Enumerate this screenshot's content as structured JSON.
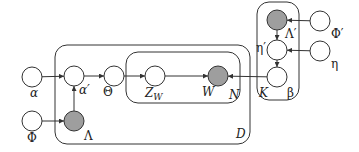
{
  "diagram": {
    "type": "plate-notation graphical model",
    "nodes": [
      {
        "id": "alpha",
        "label": "α",
        "observed": false,
        "cx": 32,
        "cy": 77,
        "lx": 30,
        "ly": 97,
        "italic": true
      },
      {
        "id": "phi",
        "label": "Φ",
        "observed": false,
        "cx": 32,
        "cy": 121,
        "lx": 27,
        "ly": 142,
        "italic": false
      },
      {
        "id": "alpha_prime",
        "label": "α′",
        "observed": false,
        "cx": 74,
        "cy": 76,
        "lx": 79,
        "ly": 94,
        "italic": true
      },
      {
        "id": "lambda",
        "label": "Λ",
        "observed": true,
        "cx": 74,
        "cy": 121,
        "lx": 84,
        "ly": 140,
        "italic": false
      },
      {
        "id": "theta",
        "label": "Θ",
        "observed": false,
        "cx": 114,
        "cy": 76,
        "lx": 103,
        "ly": 96,
        "italic": false
      },
      {
        "id": "z_w",
        "label": "Z",
        "sub": "W",
        "observed": false,
        "cx": 155,
        "cy": 76,
        "lx": 145,
        "ly": 97,
        "italic": true
      },
      {
        "id": "w",
        "label": "W",
        "observed": true,
        "cx": 218,
        "cy": 76,
        "lx": 202,
        "ly": 96,
        "italic": true
      },
      {
        "id": "lambda_prime",
        "label": "Λ′",
        "observed": true,
        "cx": 277,
        "cy": 20,
        "lx": 285,
        "ly": 38,
        "italic": false
      },
      {
        "id": "eta_prime",
        "label": "η′",
        "observed": false,
        "cx": 277,
        "cy": 50,
        "lx": 256,
        "ly": 52,
        "italic": false
      },
      {
        "id": "beta",
        "label": "β",
        "observed": false,
        "cx": 277,
        "cy": 77,
        "lx": 287,
        "ly": 97,
        "italic": false
      },
      {
        "id": "phi_prime",
        "label": "Φ′",
        "observed": false,
        "cx": 320,
        "cy": 21,
        "lx": 331,
        "ly": 38,
        "italic": false
      },
      {
        "id": "eta",
        "label": "η",
        "observed": false,
        "cx": 320,
        "cy": 51,
        "lx": 331,
        "ly": 68,
        "italic": false
      }
    ],
    "edges": [
      {
        "from": "alpha",
        "to": "alpha_prime"
      },
      {
        "from": "phi",
        "to": "lambda"
      },
      {
        "from": "lambda",
        "to": "alpha_prime"
      },
      {
        "from": "alpha_prime",
        "to": "theta"
      },
      {
        "from": "theta",
        "to": "z_w"
      },
      {
        "from": "z_w",
        "to": "w"
      },
      {
        "from": "beta",
        "to": "w"
      },
      {
        "from": "phi_prime",
        "to": "lambda_prime"
      },
      {
        "from": "lambda_prime",
        "to": "eta_prime"
      },
      {
        "from": "eta",
        "to": "eta_prime"
      },
      {
        "from": "eta_prime",
        "to": "beta"
      }
    ],
    "plates": [
      {
        "id": "plate_d",
        "label": "D",
        "x": 55,
        "y": 45,
        "w": 195,
        "h": 99,
        "lx": 236,
        "ly": 138
      },
      {
        "id": "plate_n",
        "label": "N",
        "x": 126,
        "y": 52,
        "w": 114,
        "h": 51,
        "lx": 229,
        "ly": 99
      },
      {
        "id": "plate_k",
        "label": "K",
        "x": 257,
        "y": 2,
        "w": 42,
        "h": 98,
        "lx": 259,
        "ly": 97
      }
    ],
    "colors": {
      "observed_fill": "#9e9e9e",
      "stroke": "#333333",
      "background": "#ffffff"
    }
  }
}
